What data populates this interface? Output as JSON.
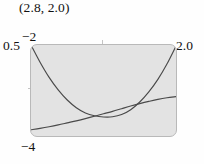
{
  "figure": {
    "point_label": "(2.8, 2.0)",
    "background_color": "#fefefe",
    "plot_background_color": "#e3e3e3",
    "plot_border_color": "#b9b9b9",
    "curve_color": "#4a4a4a"
  },
  "window": {
    "xmin_label": "−2",
    "xmax_label": "2.0",
    "ymax_label": "0.5",
    "ymin_label": "−4"
  },
  "chart_data": {
    "type": "line",
    "title": "(2.8, 2.0)",
    "xlabel": "",
    "ylabel": "",
    "xlim": [
      -2,
      2.0
    ],
    "ylim": [
      -4,
      0.5
    ],
    "grid": false,
    "legend": "none",
    "annotations": [
      {
        "text": "(2.8, 2.0)",
        "position": "above-plot-left"
      }
    ],
    "axis_tick_labels": {
      "x": [
        "−2",
        "2.0"
      ],
      "y": [
        "0.5",
        "−4"
      ]
    },
    "series": [
      {
        "name": "parabola",
        "x": [
          -2.0,
          -1.75,
          -1.5,
          -1.25,
          -1.0,
          -0.75,
          -0.5,
          -0.25,
          0.0,
          0.25,
          0.5,
          0.75,
          1.0,
          1.25,
          1.5,
          1.75,
          2.0
        ],
        "values": [
          0.5,
          -0.35,
          -1.1,
          -1.72,
          -2.22,
          -2.6,
          -2.86,
          -3.0,
          -3.06,
          -3.05,
          -2.94,
          -2.7,
          -2.32,
          -1.82,
          -1.2,
          -0.44,
          0.45
        ]
      },
      {
        "name": "rising-curve",
        "x": [
          -2.0,
          -1.75,
          -1.5,
          -1.25,
          -1.0,
          -0.75,
          -0.5,
          -0.25,
          0.0,
          0.25,
          0.5,
          0.75,
          1.0,
          1.25,
          1.5,
          1.75,
          2.0
        ],
        "values": [
          -3.69,
          -3.62,
          -3.54,
          -3.45,
          -3.35,
          -3.25,
          -3.14,
          -3.02,
          -2.9,
          -2.78,
          -2.65,
          -2.52,
          -2.4,
          -2.29,
          -2.19,
          -2.11,
          -2.05
        ]
      }
    ]
  }
}
